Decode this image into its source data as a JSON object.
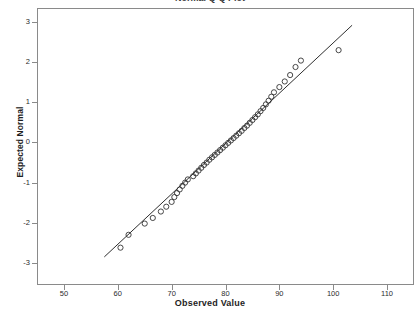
{
  "chart": {
    "title": "Normal Q-Q Plot",
    "xlabel": "Observed Value",
    "ylabel": "Expected Normal"
  },
  "chart_data": {
    "type": "scatter",
    "title": "Normal Q-Q Plot",
    "xlabel": "Observed Value",
    "ylabel": "Expected Normal",
    "xlim": [
      45,
      115
    ],
    "ylim": [
      -3.55,
      3.35
    ],
    "xticks": [
      50,
      60,
      70,
      80,
      90,
      100,
      110
    ],
    "yticks": [
      3,
      2,
      1,
      0,
      -1,
      -2,
      -3
    ],
    "grid": false,
    "legend": null,
    "marker": "open-circle",
    "series": [
      {
        "name": "Observed vs Expected Normal",
        "x": [
          60.5,
          62.0,
          65.0,
          66.5,
          68.0,
          69.0,
          70.0,
          70.5,
          71.0,
          71.5,
          72.0,
          72.5,
          73.0,
          74.0,
          74.5,
          75.0,
          75.5,
          76.0,
          76.5,
          77.0,
          77.5,
          78.0,
          78.5,
          79.0,
          79.5,
          80.0,
          80.5,
          81.0,
          81.5,
          82.0,
          82.5,
          83.0,
          83.5,
          84.0,
          84.5,
          85.0,
          85.5,
          86.0,
          86.5,
          87.0,
          87.5,
          88.0,
          88.5,
          89.0,
          90.0,
          91.0,
          92.0,
          93.0,
          94.0,
          101.0
        ],
        "y": [
          -2.62,
          -2.3,
          -2.02,
          -1.88,
          -1.72,
          -1.6,
          -1.48,
          -1.36,
          -1.26,
          -1.17,
          -1.08,
          -1.0,
          -0.92,
          -0.84,
          -0.77,
          -0.7,
          -0.63,
          -0.56,
          -0.5,
          -0.43,
          -0.37,
          -0.31,
          -0.25,
          -0.19,
          -0.13,
          -0.07,
          -0.01,
          0.05,
          0.11,
          0.17,
          0.23,
          0.29,
          0.36,
          0.42,
          0.49,
          0.56,
          0.63,
          0.7,
          0.78,
          0.86,
          0.95,
          1.04,
          1.14,
          1.25,
          1.38,
          1.52,
          1.68,
          1.88,
          2.04,
          2.3
        ]
      }
    ],
    "reference_line": {
      "type": "line",
      "x": [
        57.5,
        103.5
      ],
      "y": [
        -2.85,
        2.92
      ]
    },
    "annotations": [
      {
        "text": "outlier point right of reference line",
        "x": 101.0,
        "y": 2.3
      }
    ]
  }
}
